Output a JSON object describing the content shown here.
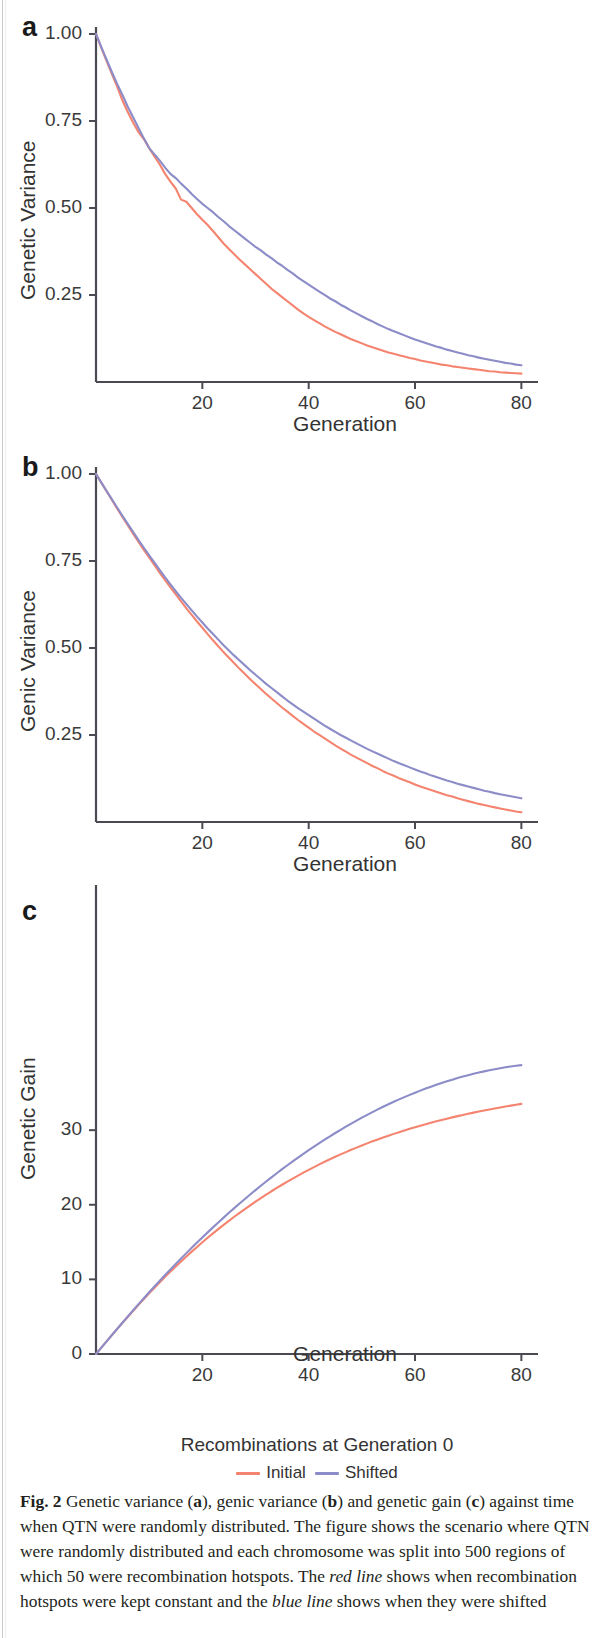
{
  "figure": {
    "label": "Fig. 2",
    "caption_parts": [
      {
        "t": "Fig. 2",
        "s": "bold"
      },
      {
        "t": "  Genetic variance (",
        "s": "normal"
      },
      {
        "t": "a",
        "s": "bold"
      },
      {
        "t": "), genic variance (",
        "s": "normal"
      },
      {
        "t": "b",
        "s": "bold"
      },
      {
        "t": ") and genetic gain (",
        "s": "normal"
      },
      {
        "t": "c",
        "s": "bold"
      },
      {
        "t": ") against time when QTN were randomly distributed. The figure shows the scenario where QTN were randomly distributed and each chromosome was split into 500 regions of which 50 were recombination hotspots. The ",
        "s": "normal"
      },
      {
        "t": "red line",
        "s": "italic"
      },
      {
        "t": " shows when recombination hotspots were kept constant and the ",
        "s": "normal"
      },
      {
        "t": "blue line",
        "s": "italic"
      },
      {
        "t": " shows when they were shifted",
        "s": "normal"
      }
    ],
    "caption_text": "Fig. 2  Genetic variance (a), genic variance (b) and genetic gain (c) against time when QTN were randomly distributed. The figure shows the scenario where QTN were randomly distributed and each chromosome was split into 500 regions of which 50 were recombination hotspots. The red line shows when recombination hotspots were kept constant and the blue line shows when they were shifted"
  },
  "legend": {
    "title": "Recombinations at  Generation 0",
    "items": [
      {
        "label": "Initial",
        "color": "#F4846F"
      },
      {
        "label": "Shifted",
        "color": "#8C8CC8"
      }
    ]
  },
  "colors": {
    "initial": "#F4846F",
    "shifted": "#8C8CC8",
    "axis": "#4a4a52",
    "text": "#333333"
  },
  "chart_data": [
    {
      "panel": "a",
      "type": "line",
      "title": "",
      "xlabel": "Generation",
      "ylabel": "Genetic Variance",
      "xlim": [
        0,
        82
      ],
      "ylim": [
        0.0,
        1.02
      ],
      "xticks": [
        20,
        40,
        60,
        80
      ],
      "xticklabels": [
        "20",
        "40",
        "60",
        "80"
      ],
      "yticks": [
        0.25,
        0.5,
        0.75,
        1.0
      ],
      "yticklabels": [
        "0.25",
        "0.50",
        "0.75",
        "1.00"
      ],
      "grid": false,
      "legend_position": "below-figure",
      "x": [
        0,
        1,
        2,
        3,
        4,
        5,
        6,
        7,
        8,
        9,
        10,
        11,
        12,
        13,
        14,
        15,
        16,
        17,
        18,
        19,
        20,
        21,
        22,
        23,
        24,
        25,
        26,
        27,
        28,
        29,
        30,
        31,
        32,
        33,
        34,
        35,
        36,
        37,
        38,
        39,
        40,
        41,
        42,
        43,
        44,
        45,
        46,
        47,
        48,
        49,
        50,
        51,
        52,
        53,
        54,
        55,
        56,
        57,
        58,
        59,
        60,
        61,
        62,
        63,
        64,
        65,
        66,
        67,
        68,
        69,
        70,
        71,
        72,
        73,
        74,
        75,
        76,
        77,
        78,
        79,
        80
      ],
      "series": [
        {
          "name": "Initial",
          "color": "#F4846F",
          "values": [
            1.0,
            0.96,
            0.922,
            0.885,
            0.848,
            0.808,
            0.775,
            0.745,
            0.718,
            0.698,
            0.672,
            0.648,
            0.625,
            0.598,
            0.576,
            0.556,
            0.524,
            0.518,
            0.5,
            0.482,
            0.466,
            0.451,
            0.434,
            0.416,
            0.398,
            0.382,
            0.367,
            0.352,
            0.338,
            0.324,
            0.31,
            0.296,
            0.282,
            0.268,
            0.256,
            0.244,
            0.232,
            0.22,
            0.208,
            0.197,
            0.187,
            0.178,
            0.169,
            0.16,
            0.152,
            0.144,
            0.137,
            0.13,
            0.123,
            0.117,
            0.111,
            0.105,
            0.1,
            0.095,
            0.09,
            0.085,
            0.081,
            0.077,
            0.073,
            0.069,
            0.066,
            0.062,
            0.059,
            0.056,
            0.053,
            0.05,
            0.048,
            0.045,
            0.043,
            0.041,
            0.039,
            0.037,
            0.035,
            0.033,
            0.031,
            0.03,
            0.028,
            0.027,
            0.026,
            0.025,
            0.024
          ]
        },
        {
          "name": "Shifted",
          "color": "#8C8CC8",
          "values": [
            1.0,
            0.962,
            0.926,
            0.89,
            0.856,
            0.824,
            0.79,
            0.76,
            0.73,
            0.7,
            0.672,
            0.654,
            0.636,
            0.616,
            0.598,
            0.586,
            0.57,
            0.556,
            0.54,
            0.526,
            0.512,
            0.5,
            0.488,
            0.474,
            0.462,
            0.448,
            0.436,
            0.424,
            0.412,
            0.4,
            0.388,
            0.378,
            0.366,
            0.356,
            0.344,
            0.334,
            0.322,
            0.312,
            0.3,
            0.29,
            0.28,
            0.27,
            0.26,
            0.25,
            0.24,
            0.232,
            0.222,
            0.214,
            0.205,
            0.197,
            0.189,
            0.181,
            0.174,
            0.166,
            0.159,
            0.152,
            0.146,
            0.14,
            0.134,
            0.128,
            0.122,
            0.117,
            0.112,
            0.107,
            0.102,
            0.098,
            0.093,
            0.089,
            0.085,
            0.081,
            0.077,
            0.074,
            0.07,
            0.067,
            0.064,
            0.061,
            0.058,
            0.055,
            0.053,
            0.05,
            0.048
          ]
        }
      ]
    },
    {
      "panel": "b",
      "type": "line",
      "title": "",
      "xlabel": "Generation",
      "ylabel": "Genic Variance",
      "xlim": [
        0,
        82
      ],
      "ylim": [
        0.0,
        1.02
      ],
      "xticks": [
        20,
        40,
        60,
        80
      ],
      "xticklabels": [
        "20",
        "40",
        "60",
        "80"
      ],
      "yticks": [
        0.25,
        0.5,
        0.75,
        1.0
      ],
      "yticklabels": [
        "0.25",
        "0.50",
        "0.75",
        "1.00"
      ],
      "grid": false,
      "legend_position": "below-figure",
      "x": [
        0,
        1,
        2,
        3,
        4,
        5,
        6,
        7,
        8,
        9,
        10,
        11,
        12,
        13,
        14,
        15,
        16,
        17,
        18,
        19,
        20,
        21,
        22,
        23,
        24,
        25,
        26,
        27,
        28,
        29,
        30,
        31,
        32,
        33,
        34,
        35,
        36,
        37,
        38,
        39,
        40,
        41,
        42,
        43,
        44,
        45,
        46,
        47,
        48,
        49,
        50,
        51,
        52,
        53,
        54,
        55,
        56,
        57,
        58,
        59,
        60,
        61,
        62,
        63,
        64,
        65,
        66,
        67,
        68,
        69,
        70,
        71,
        72,
        73,
        74,
        75,
        76,
        77,
        78,
        79,
        80
      ],
      "series": [
        {
          "name": "Initial",
          "color": "#F4846F",
          "values": [
            1.0,
            0.975,
            0.95,
            0.925,
            0.9,
            0.876,
            0.852,
            0.828,
            0.805,
            0.782,
            0.76,
            0.738,
            0.716,
            0.695,
            0.674,
            0.654,
            0.634,
            0.614,
            0.595,
            0.576,
            0.558,
            0.54,
            0.522,
            0.505,
            0.488,
            0.472,
            0.456,
            0.44,
            0.425,
            0.41,
            0.396,
            0.382,
            0.368,
            0.355,
            0.342,
            0.329,
            0.317,
            0.305,
            0.293,
            0.282,
            0.271,
            0.26,
            0.25,
            0.24,
            0.23,
            0.22,
            0.211,
            0.202,
            0.193,
            0.185,
            0.177,
            0.169,
            0.161,
            0.154,
            0.146,
            0.139,
            0.133,
            0.126,
            0.12,
            0.114,
            0.108,
            0.102,
            0.097,
            0.092,
            0.087,
            0.082,
            0.077,
            0.073,
            0.068,
            0.064,
            0.06,
            0.056,
            0.052,
            0.049,
            0.045,
            0.042,
            0.039,
            0.036,
            0.033,
            0.03,
            0.028
          ]
        },
        {
          "name": "Shifted",
          "color": "#8C8CC8",
          "values": [
            1.0,
            0.975,
            0.951,
            0.927,
            0.903,
            0.879,
            0.856,
            0.833,
            0.81,
            0.788,
            0.766,
            0.745,
            0.724,
            0.703,
            0.683,
            0.663,
            0.644,
            0.626,
            0.608,
            0.59,
            0.573,
            0.556,
            0.54,
            0.524,
            0.508,
            0.493,
            0.478,
            0.464,
            0.45,
            0.436,
            0.423,
            0.41,
            0.397,
            0.385,
            0.373,
            0.361,
            0.349,
            0.338,
            0.327,
            0.317,
            0.307,
            0.297,
            0.287,
            0.277,
            0.268,
            0.259,
            0.25,
            0.242,
            0.234,
            0.226,
            0.218,
            0.21,
            0.203,
            0.196,
            0.189,
            0.182,
            0.175,
            0.169,
            0.163,
            0.157,
            0.151,
            0.145,
            0.14,
            0.134,
            0.129,
            0.124,
            0.119,
            0.115,
            0.11,
            0.106,
            0.102,
            0.098,
            0.094,
            0.09,
            0.087,
            0.083,
            0.08,
            0.077,
            0.074,
            0.071,
            0.068
          ]
        }
      ]
    },
    {
      "panel": "c",
      "type": "line",
      "title": "",
      "xlabel": "Generation",
      "ylabel": "Genetic Gain",
      "xlim": [
        0,
        82
      ],
      "ylim": [
        0,
        39
      ],
      "xticks": [
        20,
        40,
        60,
        80
      ],
      "xticklabels": [
        "20",
        "40",
        "60",
        "80"
      ],
      "yticks": [
        0,
        10,
        20,
        30
      ],
      "yticklabels": [
        "0",
        "10",
        "20",
        "30"
      ],
      "grid": false,
      "legend_position": "below-figure",
      "x": [
        0,
        1,
        2,
        3,
        4,
        5,
        6,
        7,
        8,
        9,
        10,
        11,
        12,
        13,
        14,
        15,
        16,
        17,
        18,
        19,
        20,
        21,
        22,
        23,
        24,
        25,
        26,
        27,
        28,
        29,
        30,
        31,
        32,
        33,
        34,
        35,
        36,
        37,
        38,
        39,
        40,
        41,
        42,
        43,
        44,
        45,
        46,
        47,
        48,
        49,
        50,
        51,
        52,
        53,
        54,
        55,
        56,
        57,
        58,
        59,
        60,
        61,
        62,
        63,
        64,
        65,
        66,
        67,
        68,
        69,
        70,
        71,
        72,
        73,
        74,
        75,
        76,
        77,
        78,
        79,
        80
      ],
      "series": [
        {
          "name": "Initial",
          "color": "#F4846F",
          "values": [
            0.0,
            0.85,
            1.7,
            2.54,
            3.37,
            4.19,
            5.0,
            5.8,
            6.59,
            7.37,
            8.13,
            8.88,
            9.62,
            10.34,
            11.04,
            11.73,
            12.41,
            13.07,
            13.72,
            14.35,
            14.97,
            15.57,
            16.16,
            16.74,
            17.3,
            17.85,
            18.39,
            18.91,
            19.42,
            19.92,
            20.41,
            20.89,
            21.35,
            21.81,
            22.25,
            22.68,
            23.1,
            23.51,
            23.91,
            24.3,
            24.68,
            25.05,
            25.41,
            25.76,
            26.1,
            26.43,
            26.75,
            27.06,
            27.37,
            27.66,
            27.95,
            28.23,
            28.5,
            28.76,
            29.01,
            29.26,
            29.5,
            29.73,
            29.96,
            30.18,
            30.39,
            30.6,
            30.8,
            30.99,
            31.18,
            31.36,
            31.54,
            31.71,
            31.88,
            32.04,
            32.2,
            32.35,
            32.5,
            32.64,
            32.78,
            32.91,
            33.04,
            33.17,
            33.29,
            33.41,
            33.52
          ]
        },
        {
          "name": "Shifted",
          "color": "#8C8CC8",
          "values": [
            0.0,
            0.85,
            1.7,
            2.55,
            3.39,
            4.22,
            5.05,
            5.87,
            6.68,
            7.48,
            8.27,
            9.05,
            9.82,
            10.58,
            11.33,
            12.07,
            12.8,
            13.52,
            14.23,
            14.93,
            15.62,
            16.3,
            16.97,
            17.63,
            18.28,
            18.92,
            19.55,
            20.17,
            20.78,
            21.38,
            21.97,
            22.55,
            23.12,
            23.68,
            24.23,
            24.77,
            25.3,
            25.82,
            26.33,
            26.83,
            27.32,
            27.8,
            28.27,
            28.73,
            29.18,
            29.62,
            30.05,
            30.47,
            30.88,
            31.28,
            31.67,
            32.05,
            32.42,
            32.78,
            33.13,
            33.47,
            33.8,
            34.12,
            34.43,
            34.73,
            35.02,
            35.3,
            35.57,
            35.83,
            36.08,
            36.32,
            36.55,
            36.77,
            36.98,
            37.18,
            37.37,
            37.55,
            37.72,
            37.88,
            38.03,
            38.17,
            38.3,
            38.42,
            38.53,
            38.63,
            38.72
          ]
        }
      ]
    }
  ]
}
